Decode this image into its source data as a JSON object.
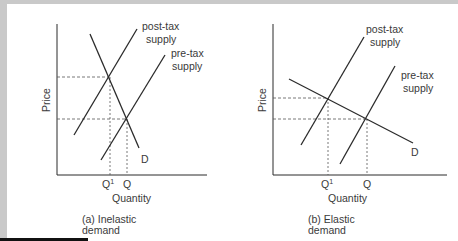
{
  "colors": {
    "background_grey": "#c9c9c9",
    "panel": "#ffffff",
    "line": "#2b2b2b",
    "dashed": "#555555",
    "text": "#3a3a3a"
  },
  "panels": [
    {
      "id": "a",
      "caption_line1": "(a) Inelastic",
      "caption_line2": "demand",
      "y_label": "Price",
      "x_label": "Quantity",
      "q1_label": "Q",
      "q1_sup": "1",
      "q_label": "Q",
      "demand_label": "D",
      "post_tax_line1": "post-tax",
      "post_tax_line2": "supply",
      "pre_tax_line1": "pre-tax",
      "pre_tax_line2": "supply"
    },
    {
      "id": "b",
      "caption_line1": "(b) Elastic",
      "caption_line2": "demand",
      "y_label": "Price",
      "x_label": "Quantity",
      "q1_label": "Q",
      "q1_sup": "1",
      "q_label": "Q",
      "demand_label": "D",
      "post_tax_line1": "post-tax",
      "post_tax_line2": "supply",
      "pre_tax_line1": "pre-tax",
      "pre_tax_line2": "supply"
    }
  ]
}
